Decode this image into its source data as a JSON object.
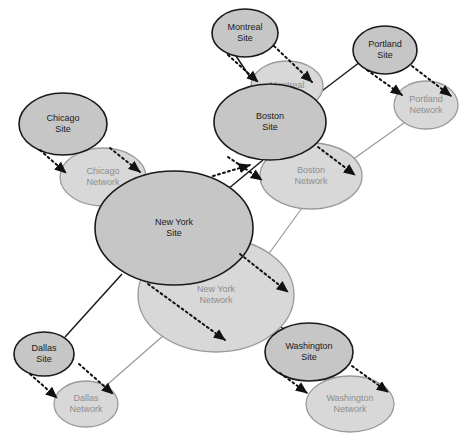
{
  "diagram": {
    "canvas": {
      "width": 473,
      "height": 443,
      "background": "#ffffff"
    },
    "colors": {
      "site_fill": "#c6c6c6",
      "site_stroke": "#1a1a1a",
      "site_text": "#1a1a1a",
      "network_fill": "#d8d8d8",
      "network_stroke": "#9a9a9a",
      "network_text": "#8d8d8d",
      "dotted_link": "#111111"
    },
    "nodes": [
      {
        "id": "montreal-site",
        "kind": "site",
        "label_line1": "Montreal",
        "label_line2": "Site",
        "cx": 245,
        "cy": 33,
        "rx": 33,
        "ry": 24
      },
      {
        "id": "montreal-network",
        "kind": "network",
        "label_line1": "Montreal",
        "label_line2": "",
        "cx": 287,
        "cy": 86,
        "rx": 36,
        "ry": 25
      },
      {
        "id": "portland-site",
        "kind": "site",
        "label_line1": "Portland",
        "label_line2": "Site",
        "cx": 385,
        "cy": 50,
        "rx": 32,
        "ry": 24
      },
      {
        "id": "portland-network",
        "kind": "network",
        "label_line1": "Portland",
        "label_line2": "Network",
        "cx": 426,
        "cy": 105,
        "rx": 32,
        "ry": 24
      },
      {
        "id": "boston-site",
        "kind": "site",
        "label_line1": "Boston",
        "label_line2": "Site",
        "cx": 270,
        "cy": 122,
        "rx": 56,
        "ry": 38
      },
      {
        "id": "boston-network",
        "kind": "network",
        "label_line1": "Boston",
        "label_line2": "Network",
        "cx": 311,
        "cy": 176,
        "rx": 51,
        "ry": 33
      },
      {
        "id": "chicago-site",
        "kind": "site",
        "label_line1": "Chicago",
        "label_line2": "Site",
        "cx": 63,
        "cy": 124,
        "rx": 44,
        "ry": 31
      },
      {
        "id": "chicago-network",
        "kind": "network",
        "label_line1": "Chicago",
        "label_line2": "Network",
        "cx": 103,
        "cy": 177,
        "rx": 43,
        "ry": 29
      },
      {
        "id": "new-york-site",
        "kind": "site",
        "label_line1": "New York",
        "label_line2": "Site",
        "cx": 174,
        "cy": 228,
        "rx": 79,
        "ry": 57
      },
      {
        "id": "new-york-network",
        "kind": "network",
        "label_line1": "New York",
        "label_line2": "Network",
        "cx": 216,
        "cy": 295,
        "rx": 78,
        "ry": 57
      },
      {
        "id": "dallas-site",
        "kind": "site",
        "label_line1": "Dallas",
        "label_line2": "Site",
        "cx": 44,
        "cy": 354,
        "rx": 30,
        "ry": 22
      },
      {
        "id": "dallas-network",
        "kind": "network",
        "label_line1": "Dallas",
        "label_line2": "Network",
        "cx": 86,
        "cy": 404,
        "rx": 32,
        "ry": 23
      },
      {
        "id": "washington-site",
        "kind": "site",
        "label_line1": "Washington",
        "label_line2": "Site",
        "cx": 309,
        "cy": 352,
        "rx": 44,
        "ry": 29
      },
      {
        "id": "washington-network",
        "kind": "network",
        "label_line1": "Washington",
        "label_line2": "Network",
        "cx": 350,
        "cy": 404,
        "rx": 44,
        "ry": 28
      }
    ],
    "site_links": [
      {
        "from": "new-york-site",
        "to": "chicago-site",
        "x1": 123,
        "y1": 184,
        "x2": 72,
        "y2": 151
      },
      {
        "from": "new-york-site",
        "to": "boston-site",
        "x1": 228,
        "y1": 189,
        "x2": 263,
        "y2": 160
      },
      {
        "from": "new-york-site",
        "to": "dallas-site",
        "x1": 122,
        "y1": 274,
        "x2": 65,
        "y2": 337
      },
      {
        "from": "new-york-site",
        "to": "washington-site",
        "x1": 226,
        "y1": 270,
        "x2": 285,
        "y2": 331
      },
      {
        "from": "boston-site",
        "to": "montreal-site",
        "x1": 256,
        "y1": 86,
        "x2": 236,
        "y2": 56
      },
      {
        "from": "boston-site",
        "to": "portland-site",
        "x1": 314,
        "y1": 97,
        "x2": 360,
        "y2": 62
      }
    ],
    "network_links": [
      {
        "from": "new-york-network",
        "to": "chicago-network",
        "x1": 163,
        "y1": 254,
        "x2": 116,
        "y2": 203
      },
      {
        "from": "new-york-network",
        "to": "boston-network",
        "x1": 265,
        "y1": 259,
        "x2": 302,
        "y2": 208
      },
      {
        "from": "new-york-network",
        "to": "dallas-network",
        "x1": 164,
        "y1": 335,
        "x2": 108,
        "y2": 384
      },
      {
        "from": "new-york-network",
        "to": "washington-network",
        "x1": 268,
        "y1": 333,
        "x2": 325,
        "y2": 380
      },
      {
        "from": "boston-network",
        "to": "portland-network",
        "x1": 352,
        "y1": 160,
        "x2": 404,
        "y2": 123
      },
      {
        "from": "montreal-network",
        "to": "boston-network",
        "x1": 300,
        "y1": 104,
        "x2": 306,
        "y2": 144
      }
    ],
    "dotted_links": [
      {
        "from": "chicago-site",
        "to": "chicago-network",
        "x1": 40,
        "y1": 150,
        "x2": 66,
        "y2": 173
      },
      {
        "from": "new-york-site",
        "to": "chicago-network",
        "x1": 110,
        "y1": 148,
        "x2": 140,
        "y2": 172
      },
      {
        "from": "montreal-site",
        "to": "montreal-network",
        "x1": 228,
        "y1": 55,
        "x2": 258,
        "y2": 82
      },
      {
        "from": "montreal-site",
        "to": "boston-site",
        "x1": 274,
        "y1": 46,
        "x2": 312,
        "y2": 82
      },
      {
        "from": "portland-site",
        "to": "portland-network",
        "x1": 367,
        "y1": 70,
        "x2": 402,
        "y2": 95
      },
      {
        "from": "portland-site",
        "to": "portland-network",
        "x1": 412,
        "y1": 66,
        "x2": 451,
        "y2": 96
      },
      {
        "from": "boston-site",
        "to": "boston-network",
        "x1": 318,
        "y1": 147,
        "x2": 355,
        "y2": 175
      },
      {
        "from": "new-york-site",
        "to": "boston-network",
        "x1": 213,
        "y1": 176,
        "x2": 250,
        "y2": 165
      },
      {
        "from": "boston-site",
        "to": "new-york-network",
        "x1": 228,
        "y1": 157,
        "x2": 262,
        "y2": 180
      },
      {
        "from": "new-york-site",
        "to": "new-york-network",
        "x1": 240,
        "y1": 254,
        "x2": 288,
        "y2": 292
      },
      {
        "from": "new-york-site",
        "to": "new-york-network",
        "x1": 148,
        "y1": 284,
        "x2": 225,
        "y2": 340
      },
      {
        "from": "dallas-site",
        "to": "dallas-network",
        "x1": 30,
        "y1": 374,
        "x2": 57,
        "y2": 398
      },
      {
        "from": "dallas-site",
        "to": "dallas-network",
        "x1": 79,
        "y1": 364,
        "x2": 113,
        "y2": 394
      },
      {
        "from": "washington-site",
        "to": "washington-network",
        "x1": 280,
        "y1": 373,
        "x2": 307,
        "y2": 393
      },
      {
        "from": "washington-site",
        "to": "washington-network",
        "x1": 352,
        "y1": 366,
        "x2": 388,
        "y2": 392
      }
    ]
  }
}
